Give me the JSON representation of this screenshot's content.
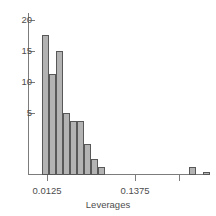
{
  "chart_data": {
    "type": "bar",
    "title": "",
    "subtitle": "",
    "xlabel": "Leverages",
    "ylabel": "",
    "grid": false,
    "legend": "none",
    "xlim": [
      0.0,
      0.16
    ],
    "ylim": [
      0,
      20
    ],
    "bin_width": 0.00625,
    "x_tick_labels": [
      "0.0125",
      "0.1375"
    ],
    "x_tick_values": [
      0.0125,
      0.1375
    ],
    "y_tick_labels": [
      "5",
      "10",
      "15",
      "20"
    ],
    "y_tick_values": [
      5,
      10,
      15,
      20
    ],
    "categories": [
      "0.0125-0.0188",
      "0.0188-0.0250",
      "0.0250-0.0313",
      "0.0313-0.0375",
      "0.0375-0.0438",
      "0.0438-0.0500",
      "0.0500-0.0563",
      "0.0563-0.0625",
      "0.0625-0.0688",
      "0.1438-0.1500",
      "0.1563-0.1625"
    ],
    "x": [
      0.0125,
      0.0188,
      0.025,
      0.0313,
      0.0375,
      0.0438,
      0.05,
      0.0563,
      0.0625,
      0.1438,
      0.1563
    ],
    "values": [
      18,
      13,
      16,
      8,
      7,
      7,
      4,
      2,
      1,
      1,
      0.4
    ],
    "bar_fill_color": "#b3b3b3",
    "bar_edge_color": "#585858",
    "axis_color": "#7c7c7c",
    "text_color": "#4d4d4d",
    "background_color": "#ffffff"
  },
  "axes": {
    "x_title": "Leverages",
    "y_ticks": [
      {
        "label": "20",
        "value": 20
      },
      {
        "label": "15",
        "value": 15
      },
      {
        "label": "10",
        "value": 10
      },
      {
        "label": "5",
        "value": 5
      }
    ],
    "x_ticks": [
      {
        "label": "0.0125",
        "value": 0.0125
      },
      {
        "label": "0.1375",
        "value": 0.1375
      }
    ]
  }
}
